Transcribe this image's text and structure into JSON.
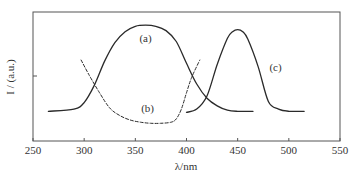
{
  "chart_data": {
    "type": "line",
    "title": "",
    "xlabel": "λ/nm",
    "ylabel": "I / (a.u.)",
    "xlim": [
      250,
      550
    ],
    "ylim": [
      0,
      1
    ],
    "x_ticks": [
      250,
      300,
      350,
      400,
      450,
      500,
      550
    ],
    "x_tick_labels": [
      "250",
      "300",
      "350",
      "400",
      "450",
      "500",
      "550"
    ],
    "y_ticks": [
      0.5
    ],
    "y_tick_labels": [
      ""
    ],
    "grid": false,
    "legend": "none (inline curve labels)",
    "series": [
      {
        "name": "(a)",
        "style": "solid",
        "x": [
          265,
          290,
          300,
          310,
          320,
          330,
          340,
          350,
          360,
          370,
          380,
          390,
          400,
          410,
          420,
          430,
          440,
          450,
          465
        ],
        "y": [
          0.19,
          0.21,
          0.27,
          0.43,
          0.65,
          0.82,
          0.92,
          0.97,
          0.98,
          0.97,
          0.93,
          0.83,
          0.63,
          0.44,
          0.31,
          0.24,
          0.2,
          0.19,
          0.19
        ]
      },
      {
        "name": "(b)",
        "style": "dashed",
        "x": [
          297,
          305,
          315,
          325,
          335,
          345,
          355,
          365,
          375,
          385,
          390,
          395,
          400,
          405,
          413
        ],
        "y": [
          0.66,
          0.52,
          0.36,
          0.22,
          0.15,
          0.11,
          0.09,
          0.08,
          0.08,
          0.09,
          0.12,
          0.21,
          0.36,
          0.5,
          0.66
        ]
      },
      {
        "name": "(c)",
        "style": "solid",
        "x": [
          400,
          410,
          420,
          430,
          440,
          445,
          450,
          455,
          460,
          470,
          480,
          490,
          500,
          515
        ],
        "y": [
          0.18,
          0.21,
          0.33,
          0.62,
          0.86,
          0.92,
          0.94,
          0.92,
          0.85,
          0.6,
          0.28,
          0.21,
          0.19,
          0.19
        ]
      }
    ],
    "annotations": [
      {
        "text": "(a)",
        "x": 360,
        "y": 0.86
      },
      {
        "text": "(b)",
        "x": 362,
        "y": 0.22
      },
      {
        "text": "(c)",
        "x": 487,
        "y": 0.6
      }
    ]
  }
}
